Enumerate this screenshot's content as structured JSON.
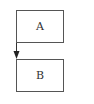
{
  "diagram": {
    "nodes": [
      {
        "id": "A",
        "label": "A"
      },
      {
        "id": "B",
        "label": "B"
      }
    ],
    "edges": [
      {
        "from": "A",
        "to": "B",
        "style": "arrow"
      }
    ],
    "colors": {
      "stroke": "#555555",
      "text": "#333333",
      "background": "#ffffff"
    }
  }
}
